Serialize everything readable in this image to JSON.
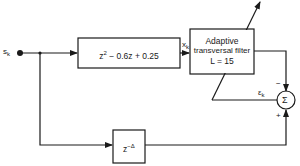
{
  "diagram": {
    "type": "block-diagram",
    "input": {
      "label": "s",
      "subscript": "k"
    },
    "blocks": {
      "channel": {
        "expr_pre": "z",
        "expr_sup": "2",
        "expr_post": " − 0.6z + 0.25"
      },
      "adaptive_filter": {
        "line1": "Adaptive",
        "line2": "transversal filter",
        "line3": "L = 15"
      },
      "delay": {
        "base": "z",
        "sup": "−Δ"
      },
      "sum": {
        "symbol": "Σ",
        "minus": "−",
        "plus": "+"
      }
    },
    "signals": {
      "filter_input": {
        "label": "x",
        "subscript": "k"
      },
      "error": {
        "label": "ε",
        "subscript": "k"
      }
    },
    "colors": {
      "line": "#1a1a1a",
      "background": "#ffffff"
    }
  }
}
